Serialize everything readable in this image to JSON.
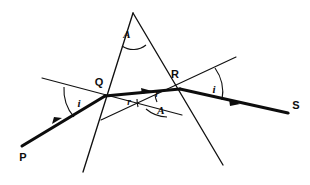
{
  "figure": {
    "background_color": "#ffffff",
    "line_color": "#111111",
    "ray_color": "#0d0d0d",
    "width": 310,
    "height": 185
  },
  "points": {
    "apex": {
      "label": "A",
      "x": 133,
      "y": 13
    },
    "entry": {
      "label": "Q",
      "x": 105,
      "y": 96
    },
    "exit": {
      "label": "R",
      "x": 180,
      "y": 89
    },
    "incident_start": {
      "label": "P",
      "x": 22,
      "y": 146
    },
    "emergent_end": {
      "label": "S",
      "x": 288,
      "y": 113
    }
  },
  "labels": {
    "apex_angle": "A",
    "point_q": "Q",
    "point_r": "R",
    "point_p": "P",
    "point_s": "S",
    "angle_incidence_q": "i",
    "angle_refraction_q": "r",
    "angle_refraction_r": "r",
    "angle_emergence_r": "i",
    "angle_prism_qr": "A"
  },
  "rays": [
    {
      "name": "incident-ray",
      "from": "P",
      "to": "Q",
      "style": "thick",
      "arrow": true
    },
    {
      "name": "refracted-ray",
      "from": "Q",
      "to": "R",
      "style": "thick",
      "arrow": true
    },
    {
      "name": "emergent-ray",
      "from": "R",
      "to": "S",
      "style": "thick",
      "arrow": true
    }
  ],
  "construction_lines": [
    {
      "name": "normal-at-q",
      "style": "thin"
    },
    {
      "name": "normal-at-r",
      "style": "thin"
    },
    {
      "name": "base-extension-line",
      "style": "thin"
    },
    {
      "name": "prism-left-edge",
      "style": "edge"
    },
    {
      "name": "prism-right-edge",
      "style": "edge"
    }
  ]
}
